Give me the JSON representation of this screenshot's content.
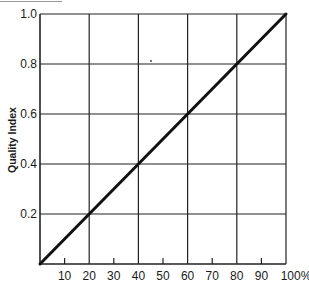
{
  "chart_data": {
    "type": "line",
    "title": "",
    "xlabel": "",
    "ylabel": "Quality Index",
    "xlim": [
      0,
      100
    ],
    "ylim": [
      0,
      1.0
    ],
    "grid": true,
    "legend": null,
    "x_ticks": [
      10,
      20,
      30,
      40,
      50,
      60,
      70,
      80,
      90,
      100
    ],
    "x_tick_labels": [
      "10",
      "20",
      "30",
      "40",
      "50",
      "60",
      "70",
      "80",
      "90",
      "100%"
    ],
    "x_gridlines": [
      20,
      40,
      60,
      80,
      100
    ],
    "y_ticks": [
      0.2,
      0.4,
      0.6,
      0.8,
      1.0
    ],
    "y_tick_labels": [
      "0.2",
      "0.4",
      "0.6",
      "0.8",
      "1.0"
    ],
    "y_gridlines": [
      0.2,
      0.4,
      0.6,
      0.8,
      1.0
    ],
    "series": [
      {
        "name": "Quality Index",
        "x": [
          0,
          20,
          40,
          60,
          80,
          100
        ],
        "y": [
          0.0,
          0.2,
          0.4,
          0.6,
          0.8,
          1.0
        ]
      }
    ]
  },
  "style": {
    "line_color": "#111111",
    "grid_color": "#222222",
    "background": "#ffffff"
  }
}
